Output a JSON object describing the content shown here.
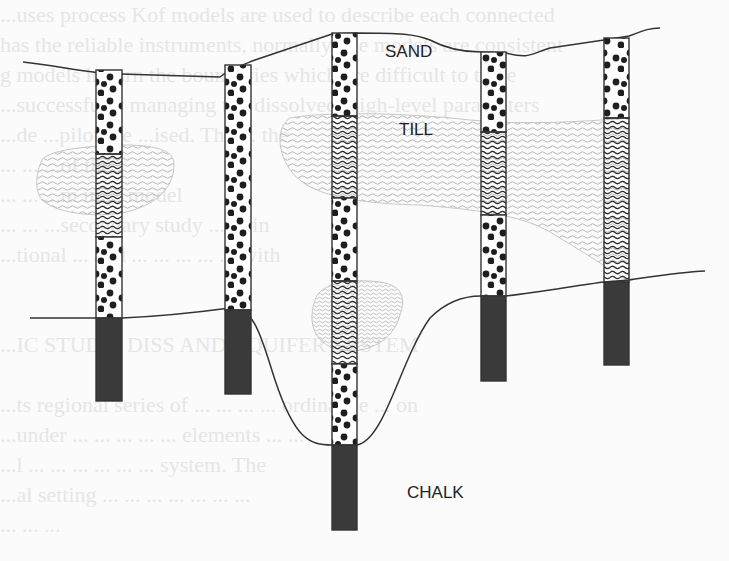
{
  "figure": {
    "type": "geological cross-section with boreholes",
    "labels": {
      "sand": "SAND",
      "till": "TILL",
      "chalk": "CHALK"
    },
    "label_positions": {
      "sand": [
        385,
        57
      ],
      "till": [
        399,
        135
      ],
      "chalk": [
        407,
        498
      ]
    },
    "colors": {
      "background": "#fbfbfb",
      "outline": "#333333",
      "chalk_fill": "#3a3a3a",
      "sand_dot": "#1e1e1e",
      "till_hatch_dark": "#2a2a2a",
      "till_lens_hatch": "#b5b5b5",
      "bleed_text": "#e6e6e6"
    },
    "legend": [
      {
        "pattern": "dots",
        "unit": "SAND"
      },
      {
        "pattern": "wavy",
        "unit": "TILL"
      },
      {
        "pattern": "solid-dark",
        "unit": "CHALK"
      }
    ],
    "boreholes": [
      {
        "id": "BH1",
        "x": 96,
        "width": 26,
        "layers": [
          {
            "unit": "sand",
            "top": 70,
            "bottom": 154
          },
          {
            "unit": "till",
            "top": 154,
            "bottom": 237
          },
          {
            "unit": "sand",
            "top": 237,
            "bottom": 318
          },
          {
            "unit": "chalk",
            "top": 318,
            "bottom": 401
          }
        ]
      },
      {
        "id": "BH2",
        "x": 225,
        "width": 26,
        "layers": [
          {
            "unit": "sand",
            "top": 65,
            "bottom": 310
          },
          {
            "unit": "chalk",
            "top": 310,
            "bottom": 394
          }
        ]
      },
      {
        "id": "BH3",
        "x": 332,
        "width": 25,
        "layers": [
          {
            "unit": "sand",
            "top": 33,
            "bottom": 116
          },
          {
            "unit": "till",
            "top": 116,
            "bottom": 198
          },
          {
            "unit": "sand",
            "top": 198,
            "bottom": 281
          },
          {
            "unit": "till",
            "top": 281,
            "bottom": 364
          },
          {
            "unit": "sand",
            "top": 364,
            "bottom": 445
          },
          {
            "unit": "chalk",
            "top": 445,
            "bottom": 530
          }
        ]
      },
      {
        "id": "BH4",
        "x": 481,
        "width": 25,
        "layers": [
          {
            "unit": "sand",
            "top": 52,
            "bottom": 132
          },
          {
            "unit": "till",
            "top": 132,
            "bottom": 215
          },
          {
            "unit": "sand",
            "top": 215,
            "bottom": 296
          },
          {
            "unit": "chalk",
            "top": 296,
            "bottom": 381
          }
        ]
      },
      {
        "id": "BH5",
        "x": 604,
        "width": 25,
        "layers": [
          {
            "unit": "sand",
            "top": 38,
            "bottom": 118
          },
          {
            "unit": "till",
            "top": 118,
            "bottom": 282
          },
          {
            "unit": "chalk",
            "top": 282,
            "bottom": 365
          }
        ]
      }
    ],
    "ground_surface": "M 23 62 C 60 66, 90 74, 120 74 L 220 77 C 228 70, 240 66, 255 60 L 332 34 L 357 33 C 400 33, 415 34, 430 40 C 445 48, 460 52, 481 52 L 506 53 C 530 59, 530 54, 550 48 L 604 40 L 629 36 C 645 30, 650 28, 660 28",
    "chalk_surface": "M 30 318 L 96 318 L 122 318 C 170 316, 200 312, 230 308 C 255 306, 262 340, 275 380 C 295 440, 310 445, 332 445 L 357 445 C 385 440, 400 360, 430 318 C 450 298, 470 296, 481 296 L 506 296 C 540 292, 580 285, 604 282 L 629 280 C 650 277, 680 272, 705 271",
    "till_lenses": [
      {
        "name": "left-till-lens",
        "path": "M 42 160 C 48 150, 90 145, 130 145 C 155 146, 172 150, 174 162 C 175 185, 160 205, 122 213 C 90 218, 55 212, 42 200 C 34 190, 36 172, 42 160 Z"
      },
      {
        "name": "main-till-lens",
        "path": "M 290 118 C 320 112, 400 112, 470 120 C 520 125, 580 122, 629 118 L 629 282 C 615 272, 580 250, 550 232 C 520 215, 480 210, 420 205 C 370 204, 320 198, 300 180 C 280 165, 272 130, 290 118 Z"
      },
      {
        "name": "middle-till-lens",
        "path": "M 315 300 C 320 283, 350 278, 380 282 C 405 286, 405 300, 400 315 C 395 333, 380 350, 350 351 C 320 350, 305 330, 315 300 Z"
      }
    ],
    "background_bleed_text": [
      "...uses process Kof models are used to describe each connected",
      "has the reliable instruments, normally, the models are consistent",
      "g models in turn the boundaries which are difficult to trace",
      "...successfully managing the dissolved, high-level parameters",
      "...de      ...pilot the                   ...ised. The ... the",
      "...        ...                            ...of the ...",
      "...        ...                    ...m in ... model",
      "...              ...      ...secondary study ... ... in",
      "...tional ... and ... ... ... ... ... with",
      "",
      "",
      "...IC STUDY: DISS AND AQUIFER SYSTEM",
      "",
      "...ts regional series of ... ... ... ... ordinance ... on",
      "...under ... ... ... ... ... elements ... ...",
      "...l ... ... ... ... ... ... system. The",
      "...al setting ... ... ... ... ... ... ...",
      "...      ...       ..."
    ]
  }
}
